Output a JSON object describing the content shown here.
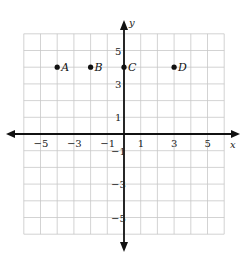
{
  "chart_data": {
    "type": "scatter",
    "title": "",
    "xlabel": "x",
    "ylabel": "y",
    "xlim": [
      -6,
      6
    ],
    "ylim": [
      -6,
      6
    ],
    "grid": true,
    "x_tick_labels": [
      "-5",
      "-3",
      "-1",
      "1",
      "3",
      "5"
    ],
    "x_tick_values": [
      -5,
      -3,
      -1,
      1,
      3,
      5
    ],
    "y_tick_labels": [
      "5",
      "3",
      "1",
      "-1",
      "-3",
      "-5"
    ],
    "y_tick_values": [
      5,
      3,
      1,
      -1,
      -3,
      -5
    ],
    "points": [
      {
        "label": "A",
        "x": -4,
        "y": 4
      },
      {
        "label": "B",
        "x": -2,
        "y": 4
      },
      {
        "label": "C",
        "x": 0,
        "y": 4
      },
      {
        "label": "D",
        "x": 3,
        "y": 4
      }
    ]
  },
  "colors": {
    "grid": "#c8c8c8",
    "axis": "#111111",
    "point": "#111111"
  }
}
